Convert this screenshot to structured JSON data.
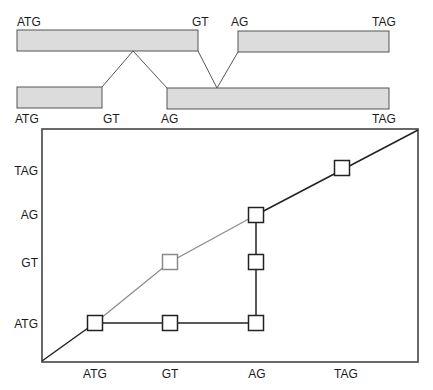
{
  "colors": {
    "exon_fill": "#dcdcdc",
    "exon_stroke": "#555555",
    "line_dark": "#222222",
    "line_gray": "#8a8a8a",
    "frame": "#444444",
    "text": "#1a1a1a"
  },
  "gene_structure": {
    "top_row": {
      "labels": [
        {
          "text": "ATG",
          "x": 17,
          "y": 26
        },
        {
          "text": "GT",
          "x": 192,
          "y": 26
        },
        {
          "text": "AG",
          "x": 231,
          "y": 26
        },
        {
          "text": "TAG",
          "x": 372,
          "y": 26
        }
      ],
      "exons": [
        {
          "x": 17,
          "y": 30,
          "w": 181,
          "h": 21
        },
        {
          "x": 238,
          "y": 31,
          "w": 151,
          "h": 21
        }
      ]
    },
    "bottom_row": {
      "labels": [
        {
          "text": "ATG",
          "x": 15,
          "y": 123
        },
        {
          "text": "GT",
          "x": 103,
          "y": 123
        },
        {
          "text": "AG",
          "x": 161,
          "y": 123
        },
        {
          "text": "TAG",
          "x": 372,
          "y": 123
        }
      ],
      "exons": [
        {
          "x": 17,
          "y": 87,
          "w": 85,
          "h": 21
        },
        {
          "x": 167,
          "y": 88,
          "w": 222,
          "h": 21
        }
      ]
    },
    "intron_connectors": [
      {
        "points": "102,87 133,51 167,88"
      },
      {
        "points": "198,51 217,88 238,52"
      }
    ]
  },
  "dot_plot": {
    "frame": {
      "x": 42,
      "y": 129,
      "w": 376,
      "h": 233
    },
    "y_axis_labels": [
      {
        "text": "TAG",
        "y": 175
      },
      {
        "text": "AG",
        "y": 219
      },
      {
        "text": "GT",
        "y": 267
      },
      {
        "text": "ATG",
        "y": 328
      }
    ],
    "x_axis_labels": [
      {
        "text": "ATG",
        "x": 95
      },
      {
        "text": "GT",
        "x": 170
      },
      {
        "text": "AG",
        "x": 257
      },
      {
        "text": "TAG",
        "x": 346
      }
    ],
    "x_label_y": 378,
    "paths": [
      {
        "name": "start-diagonal",
        "color": "dark",
        "points": "42,361 95,323"
      },
      {
        "name": "atg-row-path",
        "color": "dark",
        "points": "95,323 256,323"
      },
      {
        "name": "ag-column-path",
        "color": "dark",
        "points": "256,323 256,215"
      },
      {
        "name": "gt-gray-path",
        "color": "gray",
        "points": "95,323 170,262 256,215"
      },
      {
        "name": "end-diagonal",
        "color": "dark",
        "points": "256,215 418,130"
      }
    ],
    "nodes": [
      {
        "id": "ATG-ATG",
        "cx": 95,
        "cy": 323,
        "color": "dark"
      },
      {
        "id": "GT-ATG",
        "cx": 170,
        "cy": 323,
        "color": "dark"
      },
      {
        "id": "AG-ATG",
        "cx": 256,
        "cy": 323,
        "color": "dark"
      },
      {
        "id": "AG-GT",
        "cx": 256,
        "cy": 262,
        "color": "dark"
      },
      {
        "id": "GT-GT",
        "cx": 170,
        "cy": 262,
        "color": "gray"
      },
      {
        "id": "AG-AG",
        "cx": 256,
        "cy": 215,
        "color": "dark"
      },
      {
        "id": "TAG-TAG",
        "cx": 342,
        "cy": 168,
        "color": "dark"
      }
    ],
    "node_size": 15
  }
}
